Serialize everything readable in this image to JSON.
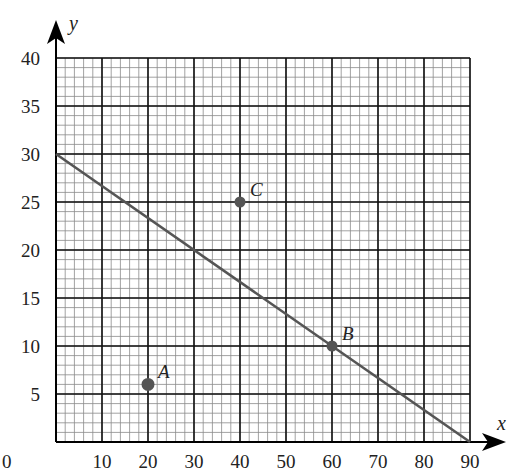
{
  "chart_data": {
    "type": "scatter",
    "title": "",
    "xlabel": "x",
    "ylabel": "y",
    "xlim": [
      0,
      90
    ],
    "ylim": [
      0,
      40
    ],
    "x_ticks": [
      10,
      20,
      30,
      40,
      50,
      60,
      70,
      80,
      90
    ],
    "y_ticks": [
      5,
      10,
      15,
      20,
      25,
      30,
      35,
      40
    ],
    "origin_label": "0",
    "grid": {
      "on": true,
      "major_x_step": 10,
      "major_y_step": 5,
      "minor_per_major": 5
    },
    "points": [
      {
        "label": "A",
        "x": 20,
        "y": 6
      },
      {
        "label": "B",
        "x": 60,
        "y": 10
      },
      {
        "label": "C",
        "x": 40,
        "y": 25
      }
    ],
    "lines": [
      {
        "from": [
          0,
          30
        ],
        "to": [
          90,
          0
        ]
      }
    ],
    "colors": {
      "point": "#555555",
      "line": "#555555",
      "grid_major": "#111111",
      "grid_minor": "#8a8a8a"
    }
  }
}
